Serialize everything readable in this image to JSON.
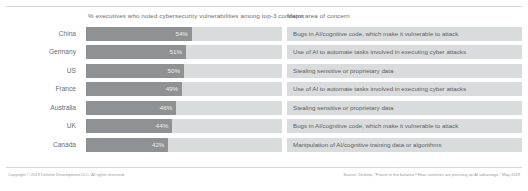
{
  "headers": {
    "left": "% executives who noted cybersecurity vulnerabilities among top-3 concerns",
    "right": "Major area of concern"
  },
  "footer": {
    "left": "Copyright © 2019 Deloitte Development LLC. All rights reserved.",
    "right": "Source: Deloitte, “Future in the balance? How countries are pursuing an AI advantage,” May 2019"
  },
  "colors": {
    "bar_fill": "#8e9294",
    "bar_track": "#d9dcdd",
    "cell_bg": "#d9dcdd",
    "value_text": "#ededed",
    "label_text": "#6e6e6e",
    "rule": "#d7d7d7",
    "background": "#ffffff"
  },
  "chart_data": {
    "type": "bar",
    "title": "",
    "xlabel": "% executives who noted cybersecurity vulnerabilities among top-3 concerns",
    "ylabel": "",
    "xlim": [
      0,
      100
    ],
    "grid": false,
    "legend": "none",
    "orientation": "horizontal",
    "categories": [
      "China",
      "Germany",
      "US",
      "France",
      "Australia",
      "UK",
      "Canada"
    ],
    "values": [
      54,
      51,
      50,
      49,
      46,
      44,
      42
    ],
    "value_labels": [
      "54%",
      "51%",
      "50%",
      "49%",
      "46%",
      "44%",
      "42%"
    ],
    "annotations": [
      "Bugs in AI/cognitive code, which make it vulnerable to attack",
      "Use of AI to automate tasks involved in executing cyber attacks",
      "Stealing sensitive or proprietary data",
      "Use of AI to automate tasks involved in executing cyber attacks",
      "Stealing sensitive or proprietary data",
      "Bugs in AI/cognitive code, which make it vulnerable to attack",
      "Manipulation of AI/cognitive training data or algorithms"
    ]
  }
}
